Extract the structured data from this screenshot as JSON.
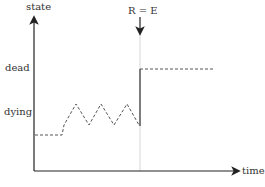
{
  "diagram": {
    "y_axis_label": "state",
    "x_axis_label": "time",
    "levels": [
      {
        "label": "dead"
      },
      {
        "label": "dying"
      }
    ],
    "marker": {
      "label": "R = E"
    },
    "colors": {
      "axis": "#222222",
      "dashed": "#555555",
      "marker_line": "#cccccc"
    }
  }
}
